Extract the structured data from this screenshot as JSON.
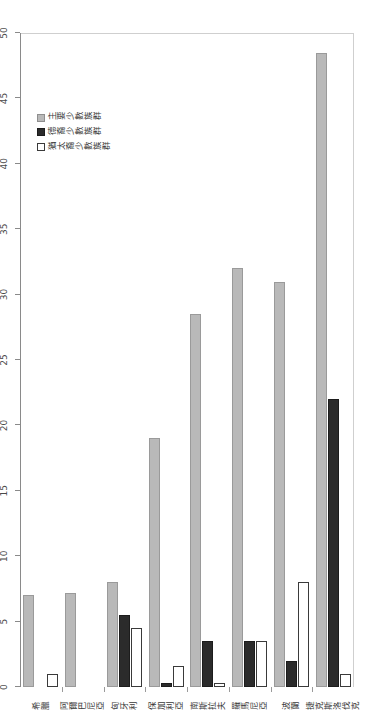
{
  "chart_data": {
    "type": "bar",
    "orientation": "horizontal",
    "title": "",
    "xlabel": "",
    "ylabel": "",
    "xlim": [
      0,
      50
    ],
    "grid": false,
    "legend_position": "upper-right",
    "tick_labels": [
      "0",
      "5",
      "10",
      "15",
      "20",
      "25",
      "30",
      "35",
      "40",
      "45",
      "50"
    ],
    "tick_values": [
      0,
      5,
      10,
      15,
      20,
      25,
      30,
      35,
      40,
      45,
      50
    ],
    "categories": [
      "希臘",
      "阿爾巴尼亞",
      "匈牙利",
      "保加利亞",
      "南斯拉夫",
      "羅馬尼亞",
      "波蘭",
      "捷克斯洛伐克"
    ],
    "series": [
      {
        "name": "主要少數族群",
        "color": "#b9b9b9",
        "values": [
          7.0,
          7.2,
          8.0,
          19.0,
          28.5,
          32.0,
          31.0,
          48.5
        ]
      },
      {
        "name": "德裔少數族群",
        "color": "#2b2b2b",
        "values": [
          0.0,
          0.0,
          5.5,
          0.3,
          3.5,
          3.5,
          2.0,
          22.0
        ]
      },
      {
        "name": "猶太裔少數族群",
        "color": "#ffffff",
        "values": [
          1.0,
          0.0,
          4.5,
          1.6,
          0.3,
          3.5,
          8.0,
          1.0
        ]
      }
    ]
  }
}
